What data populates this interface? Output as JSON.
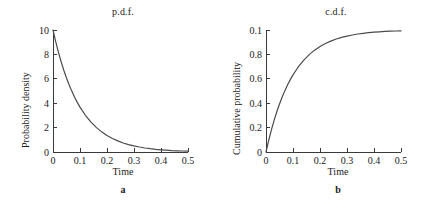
{
  "figure": {
    "background_color": "#ffffff",
    "curve_color": "#4a4a4a",
    "axis_color": "#3a3a3a",
    "text_color": "#1a1a1a"
  },
  "panels": [
    {
      "caption": "a",
      "title": "p.d.f.",
      "xlabel": "Time",
      "ylabel": "Probability density",
      "xticks": [
        "0",
        "0.1",
        "0.2",
        "0.3",
        "0.4",
        "0.5"
      ],
      "yticks": [
        "0",
        "2",
        "4",
        "6",
        "8",
        "10"
      ]
    },
    {
      "caption": "b",
      "title": "c.d.f.",
      "xlabel": "Time",
      "ylabel": "Cumulative probability",
      "xticks": [
        "0",
        "0.1",
        "0.2",
        "0.3",
        "0.4",
        "0.5"
      ],
      "yticks": [
        "0",
        "0.2",
        "0.4",
        "0.6",
        "0.8",
        "0.1"
      ]
    }
  ],
  "chart_data": [
    {
      "type": "line",
      "title": "p.d.f.",
      "subtitle": "a",
      "xlabel": "Time",
      "ylabel": "Probability density",
      "xlim": [
        0,
        0.5
      ],
      "ylim": [
        0,
        10
      ],
      "xticks": [
        0,
        0.1,
        0.2,
        0.3,
        0.4,
        0.5
      ],
      "xtick_labels": [
        "0",
        "0.1",
        "0.2",
        "0.3",
        "0.4",
        "0.5"
      ],
      "yticks": [
        0,
        2,
        4,
        6,
        8,
        10
      ],
      "ytick_labels": [
        "0",
        "2",
        "4",
        "6",
        "8",
        "10"
      ],
      "grid": false,
      "legend": false,
      "series": [
        {
          "name": "exponential p.d.f. (rate 10)",
          "x": [
            0,
            0.01,
            0.02,
            0.03,
            0.04,
            0.05,
            0.06,
            0.07,
            0.08,
            0.09,
            0.1,
            0.12,
            0.14,
            0.16,
            0.18,
            0.2,
            0.22,
            0.24,
            0.26,
            0.28,
            0.3,
            0.32,
            0.34,
            0.36,
            0.38,
            0.4,
            0.42,
            0.44,
            0.46,
            0.48,
            0.5
          ],
          "values": [
            10,
            9.05,
            8.19,
            7.41,
            6.7,
            6.07,
            5.49,
            4.97,
            4.49,
            4.07,
            3.68,
            3.01,
            2.47,
            2.02,
            1.65,
            1.35,
            1.11,
            0.91,
            0.74,
            0.61,
            0.5,
            0.41,
            0.33,
            0.27,
            0.22,
            0.18,
            0.15,
            0.12,
            0.1,
            0.08,
            0.07
          ]
        }
      ]
    },
    {
      "type": "line",
      "title": "c.d.f.",
      "subtitle": "b",
      "xlabel": "Time",
      "ylabel": "Cumulative probability",
      "xlim": [
        0,
        0.5
      ],
      "ylim": [
        0,
        1.0
      ],
      "xticks": [
        0,
        0.1,
        0.2,
        0.3,
        0.4,
        0.5
      ],
      "xtick_labels": [
        "0",
        "0.1",
        "0.2",
        "0.3",
        "0.4",
        "0.5"
      ],
      "yticks": [
        0,
        0.2,
        0.4,
        0.6,
        0.8,
        1.0
      ],
      "ytick_labels": [
        "0",
        "0.2",
        "0.4",
        "0.6",
        "0.8",
        "0.1"
      ],
      "grid": false,
      "legend": false,
      "series": [
        {
          "name": "exponential c.d.f. (rate 10)",
          "x": [
            0,
            0.01,
            0.02,
            0.03,
            0.04,
            0.05,
            0.06,
            0.07,
            0.08,
            0.09,
            0.1,
            0.12,
            0.14,
            0.16,
            0.18,
            0.2,
            0.22,
            0.24,
            0.26,
            0.28,
            0.3,
            0.32,
            0.34,
            0.36,
            0.38,
            0.4,
            0.42,
            0.44,
            0.46,
            0.48,
            0.5
          ],
          "values": [
            0,
            0.095,
            0.181,
            0.259,
            0.33,
            0.393,
            0.451,
            0.503,
            0.551,
            0.593,
            0.632,
            0.699,
            0.753,
            0.798,
            0.835,
            0.865,
            0.889,
            0.909,
            0.926,
            0.939,
            0.95,
            0.959,
            0.967,
            0.973,
            0.978,
            0.982,
            0.985,
            0.988,
            0.99,
            0.992,
            0.993
          ]
        }
      ]
    }
  ]
}
